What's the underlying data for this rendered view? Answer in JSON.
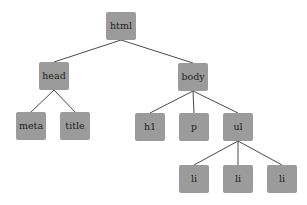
{
  "diagram": {
    "type": "tree",
    "node_color": "#9b9b9b",
    "edge_color": "#4a4a4a",
    "text_color": "#1e1e1e",
    "nodes": [
      {
        "id": "html",
        "label": "html",
        "x": 106,
        "y": 12
      },
      {
        "id": "head",
        "label": "head",
        "x": 39,
        "y": 62
      },
      {
        "id": "body",
        "label": "body",
        "x": 178,
        "y": 63
      },
      {
        "id": "meta",
        "label": "meta",
        "x": 16,
        "y": 112
      },
      {
        "id": "title",
        "label": "title",
        "x": 60,
        "y": 112
      },
      {
        "id": "h1",
        "label": "h1",
        "x": 135,
        "y": 113
      },
      {
        "id": "p",
        "label": "p",
        "x": 179,
        "y": 113
      },
      {
        "id": "ul",
        "label": "ul",
        "x": 223,
        "y": 113
      },
      {
        "id": "li1",
        "label": "li",
        "x": 179,
        "y": 165
      },
      {
        "id": "li2",
        "label": "li",
        "x": 223,
        "y": 165
      },
      {
        "id": "li3",
        "label": "li",
        "x": 267,
        "y": 165
      }
    ],
    "edges": [
      [
        "html",
        "head"
      ],
      [
        "html",
        "body"
      ],
      [
        "head",
        "meta"
      ],
      [
        "head",
        "title"
      ],
      [
        "body",
        "h1"
      ],
      [
        "body",
        "p"
      ],
      [
        "body",
        "ul"
      ],
      [
        "ul",
        "li1"
      ],
      [
        "ul",
        "li2"
      ],
      [
        "ul",
        "li3"
      ]
    ]
  }
}
